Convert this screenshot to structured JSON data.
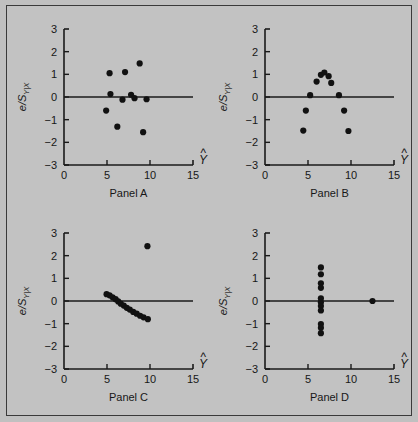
{
  "figure": {
    "background_color": "#c2c2c2",
    "border_color": "#3a3a3a",
    "point_color": "#111111",
    "axis_color": "#1a1a1a"
  },
  "axes": {
    "x": {
      "label": "Y",
      "label_accent": "^",
      "min": 0,
      "max": 15,
      "ticks": [
        0,
        5,
        10,
        15
      ],
      "tick_labels": [
        "0",
        "5",
        "10",
        "15"
      ]
    },
    "y": {
      "label_main": "e/S",
      "label_sub": "Y|X",
      "min": -3,
      "max": 3,
      "ticks": [
        3,
        2,
        1,
        0,
        -1,
        -2,
        -3
      ],
      "tick_labels": [
        "3",
        "2",
        "1",
        "0",
        "−1",
        "−2",
        "−3"
      ]
    },
    "zero_line": 0
  },
  "chart_data": [
    {
      "type": "scatter",
      "title": "Panel A",
      "xlabel": "Y-hat",
      "ylabel": "e/S_Y|X",
      "xlim": [
        0,
        15
      ],
      "ylim": [
        -3,
        3
      ],
      "grid": false,
      "legend": "none",
      "annotations": [
        "horizontal reference line at e/S = 0"
      ],
      "points": [
        {
          "x": 4.9,
          "y": -0.6
        },
        {
          "x": 5.3,
          "y": 1.05
        },
        {
          "x": 5.4,
          "y": 0.13
        },
        {
          "x": 6.2,
          "y": -1.31
        },
        {
          "x": 6.8,
          "y": -0.12
        },
        {
          "x": 7.1,
          "y": 1.1
        },
        {
          "x": 7.8,
          "y": 0.1
        },
        {
          "x": 8.2,
          "y": -0.05
        },
        {
          "x": 8.8,
          "y": 1.48
        },
        {
          "x": 9.2,
          "y": -1.55
        },
        {
          "x": 9.6,
          "y": -0.1
        }
      ]
    },
    {
      "type": "scatter",
      "title": "Panel B",
      "xlabel": "Y-hat",
      "ylabel": "e/S_Y|X",
      "xlim": [
        0,
        15
      ],
      "ylim": [
        -3,
        3
      ],
      "grid": false,
      "legend": "none",
      "annotations": [
        "inverted-U curvature in residuals"
      ],
      "points": [
        {
          "x": 4.45,
          "y": -1.48
        },
        {
          "x": 4.75,
          "y": -0.6
        },
        {
          "x": 5.25,
          "y": 0.08
        },
        {
          "x": 6.0,
          "y": 0.68
        },
        {
          "x": 6.5,
          "y": 0.98
        },
        {
          "x": 6.9,
          "y": 1.08
        },
        {
          "x": 7.4,
          "y": 0.92
        },
        {
          "x": 7.7,
          "y": 0.62
        },
        {
          "x": 8.6,
          "y": 0.08
        },
        {
          "x": 9.2,
          "y": -0.6
        },
        {
          "x": 9.7,
          "y": -1.5
        }
      ]
    },
    {
      "type": "scatter",
      "title": "Panel C",
      "xlabel": "Y-hat",
      "ylabel": "e/S_Y|X",
      "xlim": [
        0,
        15
      ],
      "ylim": [
        -3,
        3
      ],
      "grid": false,
      "legend": "none",
      "annotations": [
        "outlier at upper right",
        "descending linear band of residuals"
      ],
      "points": [
        {
          "x": 4.95,
          "y": 0.3
        },
        {
          "x": 5.3,
          "y": 0.25
        },
        {
          "x": 5.65,
          "y": 0.16
        },
        {
          "x": 6.0,
          "y": 0.08
        },
        {
          "x": 6.3,
          "y": -0.02
        },
        {
          "x": 6.6,
          "y": -0.12
        },
        {
          "x": 6.95,
          "y": -0.2
        },
        {
          "x": 7.3,
          "y": -0.3
        },
        {
          "x": 7.65,
          "y": -0.38
        },
        {
          "x": 8.05,
          "y": -0.48
        },
        {
          "x": 8.45,
          "y": -0.56
        },
        {
          "x": 8.85,
          "y": -0.65
        },
        {
          "x": 9.25,
          "y": -0.72
        },
        {
          "x": 9.75,
          "y": -0.8
        },
        {
          "x": 9.7,
          "y": 2.42
        }
      ]
    },
    {
      "type": "scatter",
      "title": "Panel D",
      "xlabel": "Y-hat",
      "ylabel": "e/S_Y|X",
      "xlim": [
        0,
        15
      ],
      "ylim": [
        -3,
        3
      ],
      "grid": false,
      "legend": "none",
      "annotations": [
        "high-leverage point far right at e/S = 0",
        "vertical cluster of residuals"
      ],
      "points": [
        {
          "x": 6.5,
          "y": 1.48
        },
        {
          "x": 6.5,
          "y": 1.18
        },
        {
          "x": 6.5,
          "y": 0.78
        },
        {
          "x": 6.5,
          "y": 0.58
        },
        {
          "x": 6.5,
          "y": 0.12
        },
        {
          "x": 6.5,
          "y": -0.05
        },
        {
          "x": 6.5,
          "y": -0.22
        },
        {
          "x": 6.5,
          "y": -0.42
        },
        {
          "x": 6.5,
          "y": -1.02
        },
        {
          "x": 6.5,
          "y": -1.18
        },
        {
          "x": 6.5,
          "y": -1.42
        },
        {
          "x": 12.5,
          "y": 0.0
        }
      ]
    }
  ]
}
